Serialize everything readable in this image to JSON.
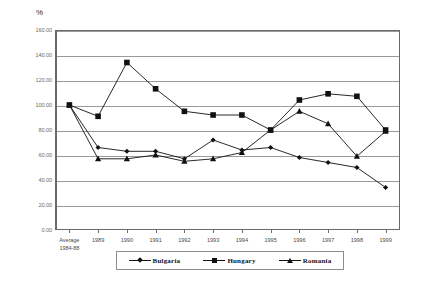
{
  "axis": {
    "y_unit_label": "%",
    "y_ticks": [
      "0.00",
      "20.00",
      "40.00",
      "60.00",
      "80.00",
      "100.00",
      "120.00",
      "140.00",
      "160.00"
    ],
    "x_first_label_line1": "Average",
    "x_first_label_line2": "1984-88"
  },
  "legend": {
    "items": [
      {
        "label": "Bulgaria",
        "marker": "diamond-marker"
      },
      {
        "label": "Hungary",
        "marker": "square-marker"
      },
      {
        "label": "Romania",
        "marker": "triangle-marker"
      }
    ]
  },
  "chart_data": {
    "type": "line",
    "title": "",
    "xlabel": "",
    "ylabel": "%",
    "ylim": [
      0,
      160
    ],
    "ytick_step": 20,
    "grid": true,
    "legend_position": "bottom",
    "categories": [
      "Average 1984-88",
      "1989",
      "1990",
      "1991",
      "1992",
      "1993",
      "1994",
      "1995",
      "1996",
      "1997",
      "1998",
      "1999"
    ],
    "series": [
      {
        "name": "Bulgaria",
        "marker": "diamond",
        "values": [
          100.0,
          66.0,
          63.0,
          63.0,
          57.0,
          72.0,
          64.0,
          66.0,
          58.0,
          54.0,
          50.0,
          34.0
        ]
      },
      {
        "name": "Hungary",
        "marker": "square",
        "values": [
          100.0,
          91.0,
          134.0,
          113.0,
          95.0,
          92.0,
          92.0,
          80.0,
          104.0,
          109.0,
          107.0,
          80.0
        ]
      },
      {
        "name": "Romania",
        "marker": "triangle",
        "values": [
          100.0,
          57.0,
          57.0,
          60.0,
          55.0,
          57.0,
          62.0,
          80.0,
          95.0,
          85.0,
          59.0,
          79.0
        ]
      }
    ]
  }
}
